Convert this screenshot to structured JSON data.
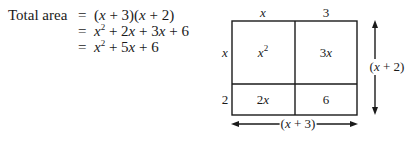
{
  "equation": {
    "lhs": "Total area",
    "lines": [
      {
        "eq": "=",
        "expr": "(x + 3)(x + 2)"
      },
      {
        "eq": "=",
        "expr": "x^2 + 2x + 3x + 6"
      },
      {
        "eq": "=",
        "expr": "x^2 + 5x + 6"
      }
    ]
  },
  "diagram": {
    "top_labels": [
      "x",
      "3"
    ],
    "left_labels": [
      "x",
      "2"
    ],
    "cells": [
      [
        "x^2",
        "3x"
      ],
      [
        "2x",
        "6"
      ]
    ],
    "height_label": "(x + 2)",
    "width_label": "(x + 3)",
    "line_color": "#1a1a1a"
  }
}
